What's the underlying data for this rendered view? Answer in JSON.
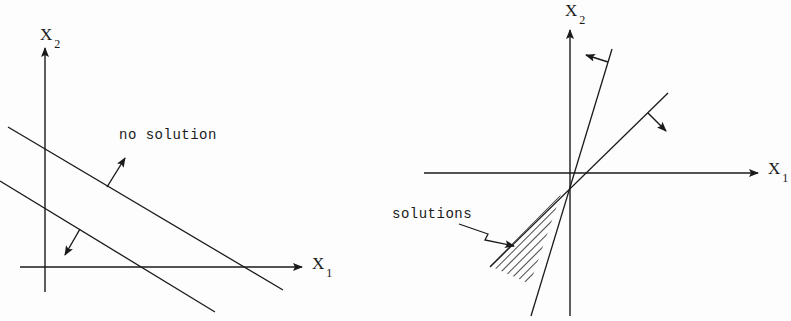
{
  "colors": {
    "ink": "#1a1a1a",
    "background": "#fdfdfd"
  },
  "left_panel": {
    "name": "no-solution-diagram",
    "x_axis": {
      "label": "X",
      "subscript": "1",
      "from": [
        20,
        267
      ],
      "to": [
        302,
        267
      ],
      "label_pos": [
        312,
        255
      ]
    },
    "y_axis": {
      "label": "X",
      "subscript": "2",
      "from": [
        45,
        292
      ],
      "to": [
        45,
        48
      ],
      "label_pos": [
        40,
        26
      ]
    },
    "lines": [
      {
        "name": "upper-constraint-line",
        "from": [
          8,
          127
        ],
        "to": [
          283,
          290
        ]
      },
      {
        "name": "lower-constraint-line",
        "from": [
          0,
          181
        ],
        "to": [
          215,
          312
        ]
      }
    ],
    "normals": [
      {
        "name": "upper-normal-arrow",
        "from": [
          107,
          187
        ],
        "to": [
          125,
          158
        ]
      },
      {
        "name": "lower-normal-arrow",
        "from": [
          80,
          229
        ],
        "to": [
          65,
          255
        ]
      }
    ],
    "annotation": {
      "text": "no solution",
      "pos": [
        119,
        128
      ]
    }
  },
  "right_panel": {
    "name": "solutions-diagram",
    "x_axis": {
      "label": "X",
      "subscript": "1",
      "from": [
        424,
        173
      ],
      "to": [
        758,
        173
      ],
      "label_pos": [
        768,
        160
      ]
    },
    "y_axis": {
      "label": "X",
      "subscript": "2",
      "from": [
        570,
        316
      ],
      "to": [
        570,
        30
      ],
      "label_pos": [
        565,
        2
      ]
    },
    "lines": [
      {
        "name": "steep-constraint-line",
        "from": [
          612,
          49
        ],
        "to": [
          531,
          316
        ]
      },
      {
        "name": "shallow-constraint-line",
        "from": [
          668,
          93
        ],
        "to": [
          490,
          267
        ]
      }
    ],
    "normals": [
      {
        "name": "steep-normal-arrow",
        "from": [
          608,
          62
        ],
        "to": [
          586,
          55
        ]
      },
      {
        "name": "shallow-normal-arrow",
        "from": [
          648,
          113
        ],
        "to": [
          666,
          131
        ]
      }
    ],
    "feasible_region": {
      "name": "hatched-solution-wedge",
      "points": [
        [
          561,
          194
        ],
        [
          490,
          266
        ],
        [
          530,
          284
        ]
      ]
    },
    "annotation": {
      "text": "solutions",
      "pos": [
        392,
        207
      ]
    },
    "pointer": {
      "points": [
        [
          459,
          224
        ],
        [
          488,
          234
        ],
        [
          485,
          240
        ],
        [
          514,
          246
        ]
      ]
    }
  }
}
